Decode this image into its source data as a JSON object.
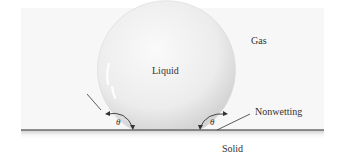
{
  "diagram": {
    "labels": {
      "gas": "Gas",
      "liquid": "Liquid",
      "solid": "Solid",
      "nonwetting": "Nonwetting",
      "theta_left": "θ",
      "theta_right": "θ"
    },
    "colors": {
      "background_panel": "#f7f7f7",
      "droplet_fill": "#e6e6e6",
      "solid_line": "#6b6b6b",
      "text": "#333333"
    }
  }
}
